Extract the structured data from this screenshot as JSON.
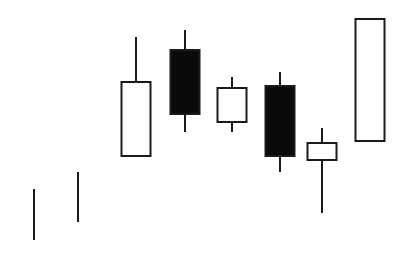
{
  "chart_data": {
    "type": "candlestick",
    "title": "",
    "xlabel": "",
    "ylabel": "",
    "grid": false,
    "legend": null,
    "value_scale": "pixel-derived (value = 256 - y)",
    "colors": {
      "stroke": "#1a1a1a",
      "bearish_fill": "#0a0a0a",
      "bullish_fill": "#ffffff",
      "background": "#ffffff"
    },
    "candles": [
      {
        "index": 1,
        "type": "line",
        "x": 34,
        "high": 67,
        "low": 16
      },
      {
        "index": 2,
        "type": "line",
        "x": 78,
        "high": 84,
        "low": 34
      },
      {
        "index": 3,
        "type": "bullish",
        "x": 136,
        "open": 100,
        "close": 174,
        "high": 219,
        "low": 100
      },
      {
        "index": 4,
        "type": "bearish",
        "x": 185,
        "open": 206,
        "close": 142,
        "high": 226,
        "low": 124
      },
      {
        "index": 5,
        "type": "bullish",
        "x": 232,
        "open": 134,
        "close": 168,
        "high": 179,
        "low": 124
      },
      {
        "index": 6,
        "type": "bearish",
        "x": 280,
        "open": 170,
        "close": 100,
        "high": 184,
        "low": 84
      },
      {
        "index": 7,
        "type": "bullish",
        "x": 322,
        "open": 96,
        "close": 113,
        "high": 128,
        "low": 43
      },
      {
        "index": 8,
        "type": "bullish",
        "x": 370,
        "open": 115,
        "close": 237,
        "high": 237,
        "low": 115
      }
    ],
    "body_width": 29
  }
}
